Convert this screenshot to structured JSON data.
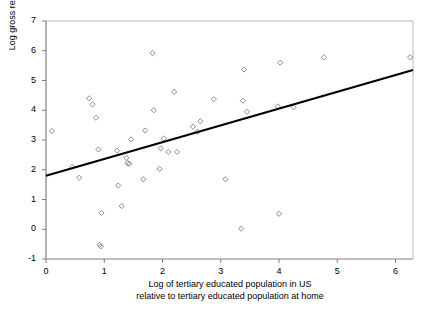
{
  "chart_data": {
    "type": "scatter",
    "title": "",
    "xlabel": "Log of tertiary educated population in US relative to tertiary educated population at home",
    "xlabel_line1": "Log of tertiary educated population in US",
    "xlabel_line2": "relative to tertiary educated population at home",
    "ylabel": "Log gross remittances",
    "xlim": [
      0,
      6.3
    ],
    "ylim": [
      -1,
      7
    ],
    "xticks": [
      0,
      1,
      2,
      3,
      4,
      5,
      6
    ],
    "xtick_labels": [
      "0",
      "1",
      "2",
      "3",
      "4",
      "5",
      "6"
    ],
    "yticks": [
      -1,
      0,
      1,
      2,
      3,
      4,
      5,
      6,
      7
    ],
    "ytick_labels": [
      "-1",
      "0",
      "1",
      "2",
      "3",
      "4",
      "5",
      "6",
      "7"
    ],
    "grid": false,
    "legend": false,
    "marker": "open-diamond",
    "marker_color": "#808080",
    "trendline_color": "#000000",
    "axis_color": "#808080",
    "points": [
      [
        0.1,
        3.3
      ],
      [
        0.45,
        2.1
      ],
      [
        0.57,
        1.73
      ],
      [
        0.74,
        4.4
      ],
      [
        0.8,
        4.2
      ],
      [
        0.86,
        3.75
      ],
      [
        0.9,
        2.68
      ],
      [
        0.92,
        -0.52
      ],
      [
        0.94,
        -0.58
      ],
      [
        0.95,
        0.55
      ],
      [
        1.22,
        2.64
      ],
      [
        1.24,
        1.47
      ],
      [
        1.3,
        0.78
      ],
      [
        1.38,
        2.4
      ],
      [
        1.4,
        2.22
      ],
      [
        1.43,
        2.2
      ],
      [
        1.46,
        3.02
      ],
      [
        1.67,
        1.68
      ],
      [
        1.7,
        3.32
      ],
      [
        1.83,
        5.92
      ],
      [
        1.85,
        4.0
      ],
      [
        1.95,
        2.03
      ],
      [
        1.97,
        2.72
      ],
      [
        2.02,
        3.05
      ],
      [
        2.1,
        2.6
      ],
      [
        2.2,
        4.62
      ],
      [
        2.25,
        2.6
      ],
      [
        2.52,
        3.45
      ],
      [
        2.6,
        3.28
      ],
      [
        2.65,
        3.63
      ],
      [
        2.88,
        4.37
      ],
      [
        3.08,
        1.68
      ],
      [
        3.35,
        0.02
      ],
      [
        3.38,
        4.32
      ],
      [
        3.4,
        5.37
      ],
      [
        3.45,
        3.95
      ],
      [
        3.98,
        4.13
      ],
      [
        4.0,
        0.52
      ],
      [
        4.02,
        5.6
      ],
      [
        4.25,
        4.1
      ],
      [
        4.77,
        5.78
      ],
      [
        6.25,
        5.78
      ]
    ],
    "trendline": {
      "x0": 0.0,
      "y0": 1.8,
      "x1": 6.3,
      "y1": 5.35
    }
  }
}
